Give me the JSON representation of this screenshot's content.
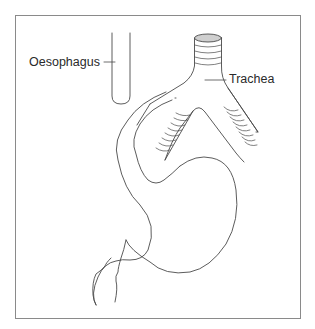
{
  "figure": {
    "labels": {
      "oesophagus": "Oesophagus",
      "trachea": "Trachea"
    },
    "colors": {
      "line": "#4a4a4a",
      "frame": "#8a8a8a",
      "trachea_top_fill": "#cfcfcf",
      "background": "#ffffff"
    }
  }
}
